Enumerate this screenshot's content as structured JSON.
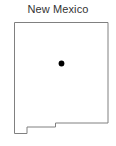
{
  "map": {
    "title": "New Mexico",
    "region_name": "New Mexico",
    "background_color": "#ffffff",
    "outline_color": "#808080",
    "outline_width": 1,
    "fill_color": "#ffffff",
    "title_color": "#333333",
    "title_font_size": 11,
    "viewbox": "0 0 116 146",
    "state_outline_path": "M14.5,22.5 L108,22.5 L108,123 L55.5,123 L55.5,127 L27,127 L27,133.5 L14.5,133.5 Z",
    "marker": {
      "name": "Albuquerque",
      "label": "",
      "shape": "circle",
      "color": "#000000",
      "cx": 61.5,
      "cy": 63.5,
      "r": 2.9
    },
    "icons": {
      "dot": "filled-circle-marker"
    }
  }
}
